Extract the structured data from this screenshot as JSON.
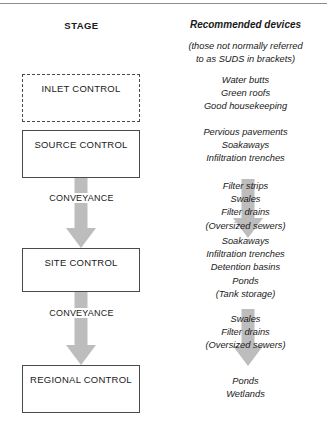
{
  "headers": {
    "left": "STAGE",
    "right": "Recommended devices"
  },
  "note": {
    "line1": "(those not normally referred",
    "line2": "to as SUDS in brackets)"
  },
  "stages": [
    {
      "id": "inlet",
      "label": "INLET CONTROL",
      "style": "dashed"
    },
    {
      "id": "source",
      "label": "SOURCE CONTROL",
      "style": "solid"
    },
    {
      "id": "site",
      "label": "SITE CONTROL",
      "style": "solid"
    },
    {
      "id": "regional",
      "label": "REGIONAL CONTROL",
      "style": "solid"
    }
  ],
  "conveyance": {
    "first": "CONVEYANCE",
    "second": "CONVEYANCE"
  },
  "devices": {
    "inlet": [
      "Water butts",
      "Green roofs",
      "Good housekeeping"
    ],
    "source": [
      "Pervious pavements",
      "Soakaways",
      "Infiltration trenches"
    ],
    "conveyance_first": [
      "Filter strips",
      "Swales",
      "Filter drains",
      "(Oversized sewers)"
    ],
    "site": [
      "Soakaways",
      "Infiltration trenches",
      "Detention basins",
      "Ponds",
      "(Tank storage)"
    ],
    "conveyance_second": [
      "Swales",
      "Filter drains",
      "(Oversized sewers)"
    ],
    "regional": [
      "Ponds",
      "Wetlands"
    ]
  },
  "colors": {
    "arrow_gray": "#bdbdbd",
    "box_border": "#4a4a4a",
    "rule": "#8d8d8d",
    "text": "#1a1a1a"
  }
}
